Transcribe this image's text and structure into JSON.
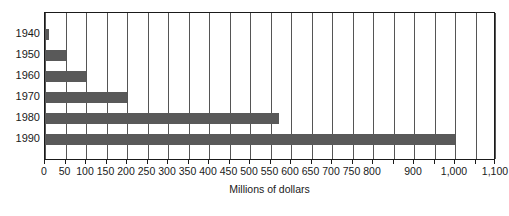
{
  "chart_data": {
    "type": "bar",
    "orientation": "horizontal",
    "title": "",
    "subtitle": "",
    "xlabel": "Millions of dollars",
    "ylabel": "",
    "categories": [
      "1940",
      "1950",
      "1960",
      "1970",
      "1980",
      "1990"
    ],
    "values": [
      10,
      50,
      100,
      200,
      570,
      1000
    ],
    "series": [
      {
        "name": "",
        "values": [
          10,
          50,
          100,
          200,
          570,
          1000
        ]
      }
    ],
    "xlim": [
      0,
      1100
    ],
    "ylim": null,
    "x_tick_step": 50,
    "x_ticks": [
      0,
      50,
      100,
      150,
      200,
      250,
      300,
      350,
      400,
      450,
      500,
      550,
      600,
      650,
      700,
      750,
      800,
      850,
      900,
      950,
      1000,
      1050,
      1100
    ],
    "x_tick_labels": [
      {
        "value": 0,
        "text": "0"
      },
      {
        "value": 50,
        "text": "50"
      },
      {
        "value": 100,
        "text": "100"
      },
      {
        "value": 150,
        "text": "150"
      },
      {
        "value": 200,
        "text": "200"
      },
      {
        "value": 250,
        "text": "250"
      },
      {
        "value": 300,
        "text": "300"
      },
      {
        "value": 350,
        "text": "350"
      },
      {
        "value": 400,
        "text": "400"
      },
      {
        "value": 450,
        "text": "450"
      },
      {
        "value": 500,
        "text": "500"
      },
      {
        "value": 550,
        "text": "550"
      },
      {
        "value": 600,
        "text": "600"
      },
      {
        "value": 650,
        "text": "650"
      },
      {
        "value": 700,
        "text": "700"
      },
      {
        "value": 750,
        "text": "750"
      },
      {
        "value": 800,
        "text": "800"
      },
      {
        "value": 900,
        "text": "900"
      },
      {
        "value": 1000,
        "text": "1,000"
      },
      {
        "value": 1100,
        "text": "1,100"
      }
    ],
    "grid": true,
    "grid_axis": "x",
    "legend": false,
    "legend_position": "none",
    "bar_color": "#595959",
    "grid_color": "#555555",
    "frame_color": "#1a1a1a",
    "background_color": "#ffffff",
    "annotations": []
  }
}
